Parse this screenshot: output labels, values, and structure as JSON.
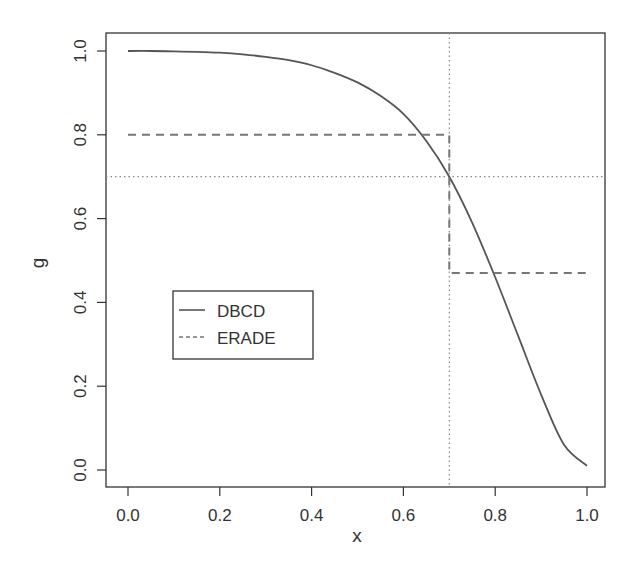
{
  "chart_data": {
    "type": "line",
    "title": "",
    "xlabel": "x",
    "ylabel": "g",
    "xlim": [
      0,
      1
    ],
    "ylim": [
      0,
      1
    ],
    "x_ticks": [
      "0.0",
      "0.2",
      "0.4",
      "0.6",
      "0.8",
      "1.0"
    ],
    "y_ticks": [
      "0.0",
      "0.2",
      "0.4",
      "0.6",
      "0.8",
      "1.0"
    ],
    "grid": false,
    "legend": {
      "position": "inside-left-middle",
      "entries": [
        "DBCD",
        "ERADE"
      ]
    },
    "series": [
      {
        "name": "DBCD",
        "style": "solid",
        "x": [
          0.0,
          0.05,
          0.1,
          0.15,
          0.2,
          0.25,
          0.3,
          0.35,
          0.4,
          0.45,
          0.5,
          0.55,
          0.6,
          0.65,
          0.7,
          0.75,
          0.8,
          0.85,
          0.9,
          0.95,
          1.0
        ],
        "y": [
          1.0,
          1.0,
          0.999,
          0.998,
          0.996,
          0.992,
          0.986,
          0.978,
          0.966,
          0.948,
          0.925,
          0.893,
          0.85,
          0.785,
          0.7,
          0.59,
          0.46,
          0.32,
          0.18,
          0.06,
          0.01
        ]
      },
      {
        "name": "ERADE",
        "style": "dashed",
        "x": [
          0.0,
          0.7,
          0.7,
          1.0
        ],
        "y": [
          0.8,
          0.8,
          0.47,
          0.47
        ]
      }
    ],
    "reference_lines": [
      {
        "orientation": "vertical",
        "value": 0.7,
        "style": "dotted"
      },
      {
        "orientation": "horizontal",
        "value": 0.7,
        "style": "dotted"
      }
    ]
  }
}
